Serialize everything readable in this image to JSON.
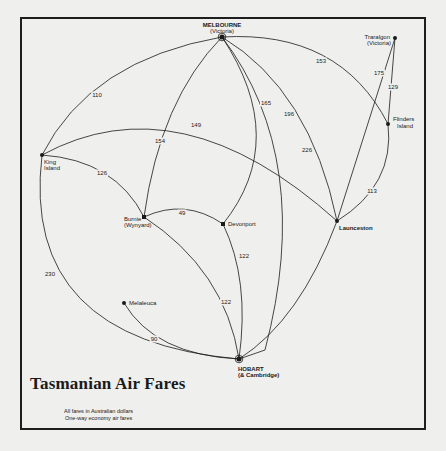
{
  "title": "Tasmanian Air Fares",
  "subtitle_lines": [
    "All fares in Australian dollars",
    "One-way economy air fares"
  ],
  "nodes": {
    "melbourne": {
      "label": "MELBOURNE",
      "sublabel": "(Victoria)",
      "x": 222,
      "y": 37
    },
    "traralgon": {
      "label": "Traralgon",
      "sublabel": "(Victoria)",
      "x": 395,
      "y": 38
    },
    "flinders": {
      "label": "Flinders",
      "sublabel": "Island",
      "x": 388,
      "y": 124
    },
    "launceston": {
      "label": "Launceston",
      "sublabel": "",
      "x": 337,
      "y": 221
    },
    "king": {
      "label": "King",
      "sublabel": "Island",
      "x": 42,
      "y": 155
    },
    "burnie": {
      "label": "Burnie",
      "sublabel": "(Wynyard)",
      "x": 144,
      "y": 217
    },
    "devonport": {
      "label": "Devonport",
      "sublabel": "",
      "x": 223,
      "y": 224
    },
    "melaleuca": {
      "label": "Melaleuca",
      "sublabel": "",
      "x": 124,
      "y": 303
    },
    "hobart": {
      "label": "HOBART",
      "sublabel": "(& Cambridge)",
      "x": 239,
      "y": 359
    }
  },
  "routes": [
    {
      "from": "Melbourne",
      "to": "King Island",
      "fare": "110"
    },
    {
      "from": "Melbourne",
      "to": "Burnie (Wynyard)",
      "fare": "154"
    },
    {
      "from": "Melbourne",
      "to": "Devonport",
      "fare": "165"
    },
    {
      "from": "Melbourne",
      "to": "Launceston",
      "fare": "196"
    },
    {
      "from": "Melbourne",
      "to": "Hobart",
      "fare": "226"
    },
    {
      "from": "Melbourne",
      "to": "Flinders Island",
      "fare": "153"
    },
    {
      "from": "King Island",
      "to": "Launceston",
      "fare": "149"
    },
    {
      "from": "King Island",
      "to": "Burnie (Wynyard)",
      "fare": "126"
    },
    {
      "from": "King Island",
      "to": "Hobart",
      "fare": "230"
    },
    {
      "from": "Burnie (Wynyard)",
      "to": "Devonport",
      "fare": "49"
    },
    {
      "from": "Burnie (Wynyard)",
      "to": "Hobart",
      "fare": "122"
    },
    {
      "from": "Devonport",
      "to": "Hobart",
      "fare": "122"
    },
    {
      "from": "Melaleuca",
      "to": "Hobart",
      "fare": "90"
    },
    {
      "from": "Traralgon",
      "to": "Launceston",
      "fare": "175"
    },
    {
      "from": "Traralgon",
      "to": "Flinders Island",
      "fare": "129"
    },
    {
      "from": "Flinders Island",
      "to": "Launceston",
      "fare": "113"
    }
  ],
  "fare_labels": {
    "mel_king": "110",
    "mel_burnie": "154",
    "mel_devonport": "165",
    "mel_launceston": "196",
    "mel_hobart": "226",
    "mel_flinders": "153",
    "king_launceston": "149",
    "king_burnie": "126",
    "king_hobart": "230",
    "burnie_devonport": "49",
    "burnie_hobart": "122",
    "devonport_hobart": "122",
    "melaleuca_hobart": "90",
    "traralgon_launceston": "175",
    "traralgon_flinders": "129",
    "flinders_launceston": "113"
  },
  "colors": {
    "background": "#efefed",
    "ink": "#1a1a1a",
    "frame": "#1e1e1e"
  }
}
